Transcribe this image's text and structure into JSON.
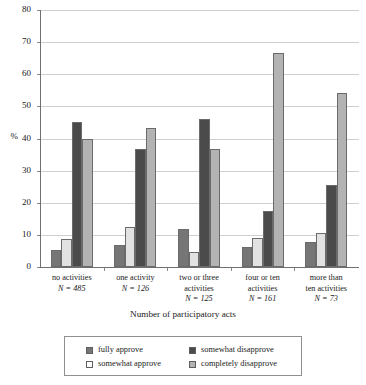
{
  "chart_data": {
    "type": "bar",
    "title": "",
    "xlabel": "Number of participatory acts",
    "ylabel": "%",
    "ylim": [
      0,
      80
    ],
    "yticks": [
      0,
      10,
      20,
      30,
      40,
      50,
      60,
      70,
      80
    ],
    "grid": true,
    "legend_position": "bottom",
    "categories": [
      "no activities",
      "one activity",
      "two or three activities",
      "four or ten activities",
      "more than ten activities"
    ],
    "category_lines": [
      [
        "no activities"
      ],
      [
        "one activity"
      ],
      [
        "two or three",
        "activities"
      ],
      [
        "four or ten",
        "activities"
      ],
      [
        "more than",
        "ten activities"
      ]
    ],
    "category_n_labels": [
      "N = 485",
      "N = 126",
      "N = 125",
      "N = 161",
      "N = 73"
    ],
    "category_n_values": [
      485,
      126,
      125,
      161,
      73
    ],
    "series": [
      {
        "name": "fully approve",
        "color": "#767676",
        "values": [
          5.3,
          6.9,
          11.9,
          6.1,
          7.9
        ]
      },
      {
        "name": "somewhat approve",
        "color": "#e2e2e2",
        "values": [
          8.8,
          12.4,
          4.6,
          9.0,
          10.6
        ]
      },
      {
        "name": "somewhat disapprove",
        "color": "#4b4b4b",
        "values": [
          45.1,
          36.6,
          46.0,
          17.3,
          25.4
        ]
      },
      {
        "name": "completely disapprove",
        "color": "#b3b3b3",
        "values": [
          39.9,
          43.4,
          36.6,
          66.7,
          54.3
        ]
      }
    ]
  },
  "axes": {
    "y_title": "%",
    "y_tick_labels": [
      "0",
      "10",
      "20",
      "30",
      "40",
      "50",
      "60",
      "70",
      "80"
    ],
    "x_title": "Number of participatory acts"
  },
  "legend": {
    "items": [
      {
        "label": "fully approve",
        "color": "#767676"
      },
      {
        "label": "somewhat approve",
        "color": "#e2e2e2"
      },
      {
        "label": "somewhat disapprove",
        "color": "#4b4b4b"
      },
      {
        "label": "completely disapprove",
        "color": "#b3b3b3"
      }
    ]
  },
  "colors": {
    "axis": "#6f6f6f",
    "grid": "#cfcfcf",
    "bar_edge": "#6b6b6b",
    "text": "#1a1a1a",
    "background": "#ffffff"
  }
}
